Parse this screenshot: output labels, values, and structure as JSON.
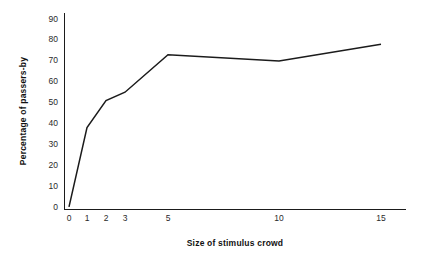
{
  "chart_data": {
    "type": "line",
    "title": "",
    "subtitle": "",
    "xlabel": "Size of stimulus crowd",
    "ylabel": "Percentage of passers-by",
    "x": [
      0,
      1,
      2,
      3,
      5,
      10,
      15
    ],
    "values": [
      1,
      39,
      52,
      56,
      74,
      71,
      79
    ],
    "series": [
      {
        "name": "Percentage of passers-by",
        "values": [
          1,
          39,
          52,
          56,
          74,
          71,
          79
        ]
      }
    ],
    "xtick_labels": [
      "0",
      "1",
      "2",
      "3",
      "5",
      "10",
      "15"
    ],
    "ytick_labels": [
      "0",
      "10",
      "20",
      "30",
      "40",
      "50",
      "60",
      "70",
      "80",
      "90"
    ],
    "ytick_values": [
      0,
      10,
      20,
      30,
      40,
      50,
      60,
      70,
      80,
      90
    ],
    "ylim": [
      0,
      94
    ],
    "xlim": [
      0,
      16
    ],
    "grid": false,
    "legend": false,
    "legend_position": "none",
    "line_color": "#1b1b1b",
    "background_color": "#ffffff",
    "annotations": []
  },
  "axes": {
    "x_axis_name": "x-axis",
    "y_axis_name": "y-axis"
  }
}
